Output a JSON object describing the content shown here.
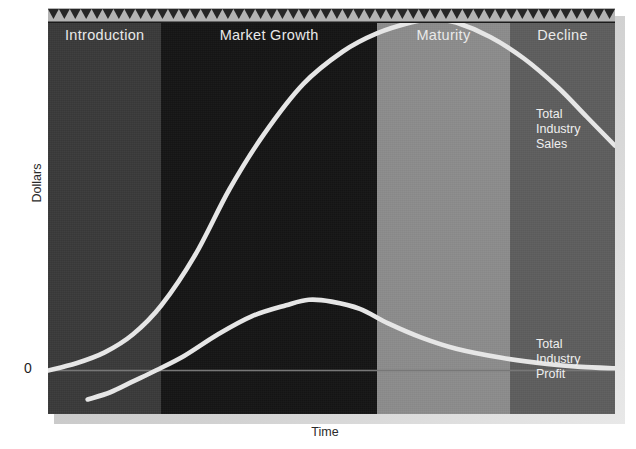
{
  "chart_data": {
    "type": "line",
    "xlabel": "Time",
    "ylabel": "Dollars",
    "origin_label": "0",
    "grid": false,
    "legend_position": "inline-right",
    "xlim": [
      0,
      100
    ],
    "ylim": [
      -12,
      100
    ],
    "stages": [
      {
        "name": "Introduction",
        "x_start": 0,
        "x_end": 20,
        "color": "#3a3a3a"
      },
      {
        "name": "Market Growth",
        "x_start": 20,
        "x_end": 58,
        "color": "#151515"
      },
      {
        "name": "Maturity",
        "x_start": 58,
        "x_end": 81.5,
        "color": "#8c8c8c"
      },
      {
        "name": "Decline",
        "x_start": 81.5,
        "x_end": 100,
        "color": "#5e5e5e"
      }
    ],
    "series": [
      {
        "name": "Total Industry Sales",
        "color": "#e6e6e6",
        "points": [
          [
            0,
            0
          ],
          [
            5,
            2
          ],
          [
            10,
            5
          ],
          [
            15,
            10
          ],
          [
            20,
            18
          ],
          [
            26,
            32
          ],
          [
            32,
            50
          ],
          [
            38,
            65
          ],
          [
            45,
            79
          ],
          [
            52,
            88
          ],
          [
            58,
            93
          ],
          [
            64,
            96
          ],
          [
            68,
            97
          ],
          [
            72,
            96
          ],
          [
            78,
            92
          ],
          [
            84,
            86
          ],
          [
            90,
            78
          ],
          [
            95,
            70
          ],
          [
            100,
            62
          ]
        ]
      },
      {
        "name": "Total Industry Profit",
        "color": "#e6e6e6",
        "points": [
          [
            7,
            -8
          ],
          [
            11,
            -6
          ],
          [
            15,
            -3
          ],
          [
            19,
            0
          ],
          [
            24,
            4
          ],
          [
            30,
            10
          ],
          [
            36,
            15
          ],
          [
            42,
            18
          ],
          [
            46,
            19.5
          ],
          [
            50,
            19
          ],
          [
            55,
            17
          ],
          [
            60,
            13
          ],
          [
            66,
            9
          ],
          [
            72,
            6
          ],
          [
            80,
            3.5
          ],
          [
            88,
            1.8
          ],
          [
            94,
            1.0
          ],
          [
            100,
            0.6
          ]
        ]
      }
    ],
    "annotations": [
      {
        "id": "sales",
        "lines": [
          "Total",
          "Industry",
          "Sales"
        ]
      },
      {
        "id": "profit",
        "lines": [
          "Total",
          "Industry",
          "Profit"
        ]
      }
    ],
    "decor": {
      "sawtooth_band_color": "#b4b4b4",
      "sawtooth_tooth_color": "#262626",
      "sawtooth_count": 52
    }
  },
  "stage_labels": {
    "introduction": "Introduction",
    "market_growth": "Market Growth",
    "maturity": "Maturity",
    "decline": "Decline"
  },
  "axes": {
    "y_title": "Dollars",
    "x_title": "Time",
    "zero": "0"
  },
  "annotations": {
    "sales_line1": "Total",
    "sales_line2": "Industry",
    "sales_line3": "Sales",
    "profit_line1": "Total",
    "profit_line2": "Industry",
    "profit_line3": "Profit"
  }
}
